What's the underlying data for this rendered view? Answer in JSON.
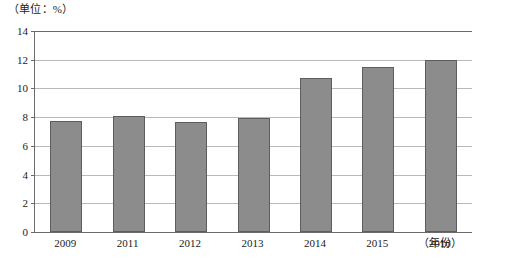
{
  "chart_data": {
    "type": "bar",
    "title": "",
    "subtitle": "",
    "unit_label": "（单位：%）",
    "xlabel": "（年份）",
    "ylabel": "",
    "categories": [
      "2009",
      "2011",
      "2012",
      "2013",
      "2014",
      "2015",
      "2016"
    ],
    "values": [
      7.7,
      8.1,
      7.65,
      7.95,
      10.7,
      11.5,
      12.0
    ],
    "series": [
      {
        "name": "",
        "values": [
          7.7,
          8.1,
          7.65,
          7.95,
          10.7,
          11.5,
          12.0
        ]
      }
    ],
    "ylim": [
      0,
      14
    ],
    "ytick_labels": [
      "0",
      "2",
      "4",
      "6",
      "8",
      "10",
      "12",
      "14"
    ],
    "ytick_values": [
      0,
      2,
      4,
      6,
      8,
      10,
      12,
      14
    ],
    "grid": true,
    "legend": "none",
    "bar_color": "#8c8c8c",
    "bar_border_color": "#5d5d5d",
    "axis_color": "#6b6b6b",
    "grid_color": "#b9b9b9",
    "background_color": "#ffffff"
  }
}
